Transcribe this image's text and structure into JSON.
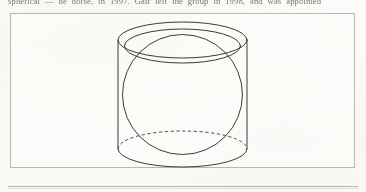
{
  "page": {
    "background_color": "#fbfbf9",
    "ink_color": "#3b3a37",
    "rule_color": "#b5b3ad",
    "frame_color": "#b9b7b1"
  },
  "running_text": {
    "line": "spherical — he horse, in 1997. Gair left the group in 1998, and was appointed"
  },
  "figure": {
    "caption": "",
    "elements": [
      {
        "name": "cylinder-top-ellipse",
        "kind": "ellipse",
        "style": "solid"
      },
      {
        "name": "cylinder-left-wall",
        "kind": "line",
        "style": "solid"
      },
      {
        "name": "cylinder-right-wall",
        "kind": "line",
        "style": "solid"
      },
      {
        "name": "cylinder-bottom-front-arc",
        "kind": "arc",
        "style": "solid"
      },
      {
        "name": "cylinder-bottom-back-arc",
        "kind": "arc",
        "style": "dashed"
      },
      {
        "name": "sphere-outline-circle",
        "kind": "circle",
        "style": "solid"
      },
      {
        "name": "sphere-equator-ellipse",
        "kind": "ellipse",
        "style": "solid"
      }
    ]
  },
  "geometry": {
    "cylinder": {
      "left_x": 108,
      "right_x": 237,
      "top_center_y": 27,
      "bottom_center_y": 136,
      "radius_x": 64.5,
      "radius_y": 18
    },
    "sphere": {
      "center_x": 172.5,
      "center_y": 81.5,
      "radius": 60,
      "equator_radius_y": 17
    }
  }
}
